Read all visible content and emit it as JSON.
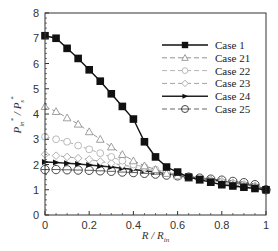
{
  "chart_data": {
    "type": "line",
    "title": "",
    "xlabel": "R / R_in",
    "ylabel": "P*_in / P*_s",
    "xlim": [
      0,
      1
    ],
    "ylim": [
      0,
      8
    ],
    "xticks": [
      "0",
      "0.2",
      "0.4",
      "0.6",
      "0.8",
      "1"
    ],
    "yticks": [
      "0",
      "1",
      "2",
      "3",
      "4",
      "5",
      "6",
      "7",
      "8"
    ],
    "grid": false,
    "legend_position": "upper right",
    "x": [
      0,
      0.05,
      0.1,
      0.15,
      0.2,
      0.25,
      0.3,
      0.35,
      0.4,
      0.45,
      0.5,
      0.55,
      0.6,
      0.65,
      0.7,
      0.75,
      0.8,
      0.85,
      0.9,
      0.95,
      1.0
    ],
    "series": [
      {
        "name": "Case 1",
        "style": "solid",
        "marker": "filled-square",
        "values": [
          7.1,
          7.0,
          6.6,
          6.2,
          5.75,
          5.3,
          4.8,
          4.3,
          3.8,
          2.9,
          2.3,
          1.9,
          1.7,
          1.5,
          1.4,
          1.3,
          1.2,
          1.15,
          1.1,
          1.05,
          1.0
        ]
      },
      {
        "name": "Case 21",
        "style": "dashed",
        "marker": "open-triangle",
        "values": [
          4.3,
          4.1,
          3.85,
          3.6,
          3.3,
          3.0,
          2.7,
          2.4,
          2.15,
          1.95,
          1.8,
          1.65,
          1.55,
          1.45,
          1.38,
          1.3,
          1.25,
          1.2,
          1.15,
          1.1,
          1.0
        ]
      },
      {
        "name": "Case 22",
        "style": "dashed",
        "marker": "open-circle-dash",
        "values": [
          3.1,
          3.0,
          2.9,
          2.75,
          2.6,
          2.45,
          2.3,
          2.15,
          2.0,
          1.9,
          1.8,
          1.7,
          1.6,
          1.5,
          1.43,
          1.36,
          1.3,
          1.24,
          1.18,
          1.12,
          1.0
        ]
      },
      {
        "name": "Case 23",
        "style": "dashed",
        "marker": "open-diamond",
        "values": [
          2.4,
          2.35,
          2.3,
          2.25,
          2.2,
          2.12,
          2.05,
          1.98,
          1.9,
          1.82,
          1.75,
          1.68,
          1.6,
          1.53,
          1.47,
          1.4,
          1.34,
          1.28,
          1.22,
          1.15,
          1.0
        ]
      },
      {
        "name": "Case 24",
        "style": "solid",
        "marker": "filled-right-triangle",
        "values": [
          2.1,
          2.08,
          2.05,
          2.02,
          1.98,
          1.94,
          1.9,
          1.85,
          1.8,
          1.75,
          1.7,
          1.64,
          1.58,
          1.52,
          1.46,
          1.4,
          1.34,
          1.28,
          1.22,
          1.15,
          1.0
        ]
      },
      {
        "name": "Case 25",
        "style": "dashed",
        "marker": "open-circle",
        "values": [
          1.8,
          1.8,
          1.79,
          1.78,
          1.77,
          1.75,
          1.73,
          1.7,
          1.68,
          1.65,
          1.62,
          1.58,
          1.55,
          1.5,
          1.46,
          1.42,
          1.38,
          1.33,
          1.28,
          1.2,
          1.0
        ]
      }
    ]
  }
}
